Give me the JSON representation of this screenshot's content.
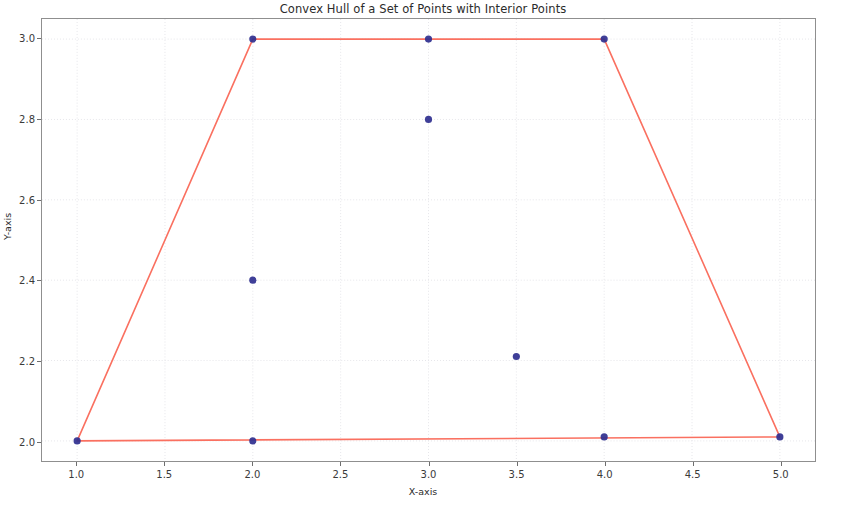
{
  "chart_data": {
    "type": "scatter",
    "title": "Convex Hull of a Set of Points with Interior Points",
    "xlabel": "X-axis",
    "ylabel": "Y-axis",
    "xlim": [
      0.8,
      5.2
    ],
    "ylim": [
      1.95,
      3.05
    ],
    "xticks": [
      "1.0",
      "1.5",
      "2.0",
      "2.5",
      "3.0",
      "3.5",
      "4.0",
      "4.5",
      "5.0"
    ],
    "xtick_values": [
      1.0,
      1.5,
      2.0,
      2.5,
      3.0,
      3.5,
      4.0,
      4.5,
      5.0
    ],
    "yticks": [
      "2.0",
      "2.2",
      "2.4",
      "2.6",
      "2.8",
      "3.0"
    ],
    "ytick_values": [
      2.0,
      2.2,
      2.4,
      2.6,
      2.8,
      3.0
    ],
    "grid": true,
    "legend": null,
    "series": [
      {
        "name": "points",
        "marker": "circle",
        "color": "#2f2f8f",
        "marker_size": 5,
        "points": [
          {
            "x": 1.0,
            "y": 2.0,
            "role": "hull-vertex"
          },
          {
            "x": 2.0,
            "y": 2.0,
            "role": "hull-vertex"
          },
          {
            "x": 4.0,
            "y": 2.01,
            "role": "hull-vertex"
          },
          {
            "x": 5.0,
            "y": 2.01,
            "role": "hull-vertex"
          },
          {
            "x": 2.0,
            "y": 3.0,
            "role": "hull-vertex"
          },
          {
            "x": 3.0,
            "y": 3.0,
            "role": "hull-vertex"
          },
          {
            "x": 4.0,
            "y": 3.0,
            "role": "hull-vertex"
          },
          {
            "x": 3.0,
            "y": 2.8,
            "role": "interior"
          },
          {
            "x": 2.0,
            "y": 2.4,
            "role": "interior"
          },
          {
            "x": 3.5,
            "y": 2.21,
            "role": "interior"
          }
        ]
      },
      {
        "name": "convex-hull",
        "type": "line",
        "color": "#fa7060",
        "linewidth": 1.6,
        "closed": true,
        "vertices": [
          {
            "x": 1.0,
            "y": 2.0
          },
          {
            "x": 5.0,
            "y": 2.01
          },
          {
            "x": 4.0,
            "y": 3.0
          },
          {
            "x": 2.0,
            "y": 3.0
          }
        ]
      }
    ],
    "colors": {
      "hull_line": "#fa7060",
      "marker": "#2f2f8f",
      "grid": "#e6e6ea",
      "axis": "#8f8f8f",
      "text": "#2b2b2b",
      "background": "#ffffff"
    }
  }
}
